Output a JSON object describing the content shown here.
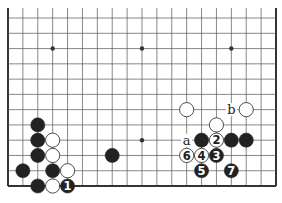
{
  "diagram": {
    "type": "go-board-partial",
    "board_size": 19,
    "visible_rows_from_bottom": 12,
    "colors": {
      "line": "#555555",
      "edge": "#333333",
      "black": "#222222",
      "white": "#ffffff",
      "label": "#222222"
    },
    "hoshi": [
      {
        "col": 3,
        "row": 3
      },
      {
        "col": 9,
        "row": 3
      },
      {
        "col": 3,
        "row": 9
      },
      {
        "col": 9,
        "row": 9
      },
      {
        "col": 15,
        "row": 9
      }
    ],
    "stones": [
      {
        "col": 2,
        "row": 4,
        "color": "black"
      },
      {
        "col": 2,
        "row": 3,
        "color": "black"
      },
      {
        "col": 3,
        "row": 3,
        "color": "white"
      },
      {
        "col": 2,
        "row": 2,
        "color": "black"
      },
      {
        "col": 3,
        "row": 2,
        "color": "white"
      },
      {
        "col": 1,
        "row": 1,
        "color": "black"
      },
      {
        "col": 3,
        "row": 1,
        "color": "black"
      },
      {
        "col": 4,
        "row": 1,
        "color": "white"
      },
      {
        "col": 2,
        "row": 0,
        "color": "black"
      },
      {
        "col": 3,
        "row": 0,
        "color": "white"
      },
      {
        "col": 4,
        "row": 0,
        "color": "black",
        "label": "1"
      },
      {
        "col": 7,
        "row": 2,
        "color": "black"
      },
      {
        "col": 12,
        "row": 5,
        "color": "white"
      },
      {
        "col": 16,
        "row": 5,
        "color": "white"
      },
      {
        "col": 14,
        "row": 4,
        "color": "white"
      },
      {
        "col": 13,
        "row": 3,
        "color": "black"
      },
      {
        "col": 14,
        "row": 3,
        "color": "white",
        "label": "2"
      },
      {
        "col": 15,
        "row": 3,
        "color": "black"
      },
      {
        "col": 16,
        "row": 3,
        "color": "black"
      },
      {
        "col": 12,
        "row": 2,
        "color": "white",
        "label": "6"
      },
      {
        "col": 13,
        "row": 2,
        "color": "white",
        "label": "4"
      },
      {
        "col": 14,
        "row": 2,
        "color": "black",
        "label": "3"
      },
      {
        "col": 13,
        "row": 1,
        "color": "black",
        "label": "5"
      },
      {
        "col": 15,
        "row": 1,
        "color": "black",
        "label": "7"
      }
    ],
    "point_labels": [
      {
        "col": 12,
        "row": 3,
        "text": "a"
      },
      {
        "col": 15,
        "row": 5,
        "text": "b"
      }
    ]
  }
}
